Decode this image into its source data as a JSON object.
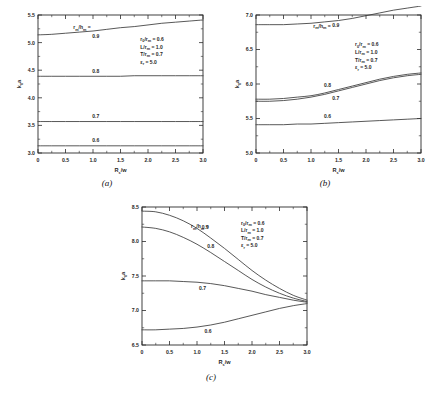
{
  "figure": {
    "panels": [
      {
        "id": "a",
        "caption": "(a)",
        "xlabel_main": "R",
        "xlabel_sub": "s",
        "xlabel_tail": "/w",
        "ylabel_main": "k",
        "ylabel_sub": "0",
        "ylabel_tail": "a",
        "legend_key_main": "r",
        "legend_key_sub1": "m",
        "legend_key_mid": "/h",
        "legend_key_sub2": "m",
        "legend_key_tail": " =",
        "params": [
          {
            "sym": "r",
            "sub": "0",
            "mid": "/r",
            "sub2": "m",
            "val": " = 0.6"
          },
          {
            "sym": "L",
            "sub": "",
            "mid": "/r",
            "sub2": "m",
            "val": " = 1.0"
          },
          {
            "sym": "T",
            "sub": "",
            "mid": "/r",
            "sub2": "m",
            "val": " = 0.7"
          },
          {
            "sym": "ε",
            "sub": "r",
            "mid": "",
            "sub2": "",
            "val": " = 5.0"
          }
        ],
        "xticks": [
          "0",
          "0.5",
          "1.0",
          "1.5",
          "2.0",
          "2.5",
          "3.0"
        ],
        "yticks": [
          "3.0",
          "3.5",
          "4.0",
          "4.5",
          "5.0",
          "5.5"
        ],
        "curve_labels": [
          "0.9",
          "0.8",
          "0.7",
          "0.6"
        ]
      },
      {
        "id": "b",
        "caption": "(b)",
        "xlabel_main": "R",
        "xlabel_sub": "s",
        "xlabel_tail": "/w",
        "ylabel_main": "k",
        "ylabel_sub": "0",
        "ylabel_tail": "a",
        "legend_key_main": "r",
        "legend_key_sub1": "m",
        "legend_key_mid": "/h",
        "legend_key_sub2": "m",
        "legend_key_tail": " =",
        "params": [
          {
            "sym": "r",
            "sub": "0",
            "mid": "/r",
            "sub2": "m",
            "val": " = 0.6"
          },
          {
            "sym": "L",
            "sub": "",
            "mid": "/r",
            "sub2": "m",
            "val": " = 1.0"
          },
          {
            "sym": "T",
            "sub": "",
            "mid": "/r",
            "sub2": "m",
            "val": " = 0.7"
          },
          {
            "sym": "ε",
            "sub": "r",
            "mid": "",
            "sub2": "",
            "val": " = 5.0"
          }
        ],
        "xticks": [
          "0",
          "0.5",
          "1.0",
          "1.5",
          "2.0",
          "2.5",
          "3.0"
        ],
        "yticks": [
          "5.0",
          "5.5",
          "6.0",
          "6.5",
          "7.0"
        ],
        "curve_labels": [
          "0.9",
          "0.8",
          "0.7",
          "0.6"
        ]
      },
      {
        "id": "c",
        "caption": "(c)",
        "xlabel_main": "R",
        "xlabel_sub": "s",
        "xlabel_tail": "/w",
        "ylabel_main": "k",
        "ylabel_sub": "0",
        "ylabel_tail": "a",
        "legend_key_main": "r",
        "legend_key_sub1": "m",
        "legend_key_mid": "/h",
        "legend_key_sub2": "m",
        "legend_key_tail": " =",
        "params": [
          {
            "sym": "r",
            "sub": "0",
            "mid": "/r",
            "sub2": "m",
            "val": " = 0.6"
          },
          {
            "sym": "L",
            "sub": "",
            "mid": "/r",
            "sub2": "m",
            "val": " = 1.0"
          },
          {
            "sym": "T",
            "sub": "",
            "mid": "/r",
            "sub2": "m",
            "val": " = 0.7"
          },
          {
            "sym": "ε",
            "sub": "r",
            "mid": "",
            "sub2": "",
            "val": " = 5.0"
          }
        ],
        "xticks": [
          "0",
          "0.5",
          "1.0",
          "1.5",
          "2.0",
          "2.5",
          "3.0"
        ],
        "yticks": [
          "6.5",
          "7.0",
          "7.5",
          "8.0",
          "8.5"
        ],
        "curve_labels": [
          "0.9",
          "0.8",
          "0.7",
          "0.6"
        ]
      }
    ]
  },
  "chart_data": [
    {
      "type": "line",
      "panel": "a",
      "title": "",
      "xlabel": "Rs/w",
      "ylabel": "k0a",
      "xlim": [
        0,
        3.0
      ],
      "ylim": [
        3.0,
        5.5
      ],
      "xticks": [
        0,
        0.5,
        1.0,
        1.5,
        2.0,
        2.5,
        3.0
      ],
      "yticks": [
        3.0,
        3.5,
        4.0,
        4.5,
        5.0,
        5.5
      ],
      "grid": false,
      "legend_title": "rm/hm =",
      "legend_position": "inline-curve-labels",
      "annotations": [
        "r0/rm = 0.6",
        "L/rm = 1.0",
        "T/rm = 0.7",
        "εr = 5.0"
      ],
      "x": [
        0,
        0.25,
        0.5,
        0.75,
        1.0,
        1.25,
        1.5,
        1.75,
        2.0,
        2.25,
        2.5,
        2.75,
        3.0
      ],
      "series": [
        {
          "name": "0.9",
          "values": [
            5.14,
            5.15,
            5.17,
            5.19,
            5.21,
            5.24,
            5.27,
            5.29,
            5.32,
            5.35,
            5.37,
            5.39,
            5.41
          ]
        },
        {
          "name": "0.8",
          "values": [
            4.39,
            4.39,
            4.39,
            4.39,
            4.39,
            4.39,
            4.39,
            4.4,
            4.4,
            4.4,
            4.4,
            4.4,
            4.4
          ]
        },
        {
          "name": "0.7",
          "values": [
            3.57,
            3.57,
            3.57,
            3.57,
            3.57,
            3.57,
            3.57,
            3.57,
            3.57,
            3.57,
            3.57,
            3.57,
            3.57
          ]
        },
        {
          "name": "0.6",
          "values": [
            3.13,
            3.13,
            3.13,
            3.13,
            3.13,
            3.13,
            3.13,
            3.13,
            3.13,
            3.13,
            3.13,
            3.13,
            3.13
          ]
        }
      ]
    },
    {
      "type": "line",
      "panel": "b",
      "title": "",
      "xlabel": "Rs/w",
      "ylabel": "k0a",
      "xlim": [
        0,
        3.0
      ],
      "ylim": [
        5.0,
        7.0
      ],
      "xticks": [
        0,
        0.5,
        1.0,
        1.5,
        2.0,
        2.5,
        3.0
      ],
      "yticks": [
        5.0,
        5.5,
        6.0,
        6.5,
        7.0
      ],
      "grid": false,
      "legend_title": "rm/hm =",
      "legend_position": "inline-curve-labels",
      "annotations": [
        "r0/rm = 0.6",
        "L/rm = 1.0",
        "T/rm = 0.7",
        "εr = 5.0"
      ],
      "x": [
        0,
        0.25,
        0.5,
        0.75,
        1.0,
        1.25,
        1.5,
        1.75,
        2.0,
        2.25,
        2.5,
        2.75,
        3.0
      ],
      "series": [
        {
          "name": "0.9",
          "values": [
            6.86,
            6.86,
            6.86,
            6.87,
            6.88,
            6.9,
            6.92,
            6.95,
            6.99,
            7.03,
            7.07,
            7.1,
            7.13
          ]
        },
        {
          "name": "0.8",
          "values": [
            5.78,
            5.78,
            5.79,
            5.81,
            5.83,
            5.87,
            5.92,
            5.97,
            6.02,
            6.07,
            6.11,
            6.14,
            6.16
          ]
        },
        {
          "name": "0.7",
          "values": [
            5.75,
            5.75,
            5.76,
            5.78,
            5.81,
            5.85,
            5.9,
            5.95,
            6.0,
            6.05,
            6.09,
            6.12,
            6.14
          ]
        },
        {
          "name": "0.6",
          "values": [
            5.41,
            5.41,
            5.41,
            5.42,
            5.42,
            5.43,
            5.44,
            5.45,
            5.46,
            5.47,
            5.48,
            5.49,
            5.5
          ]
        }
      ]
    },
    {
      "type": "line",
      "panel": "c",
      "title": "",
      "xlabel": "Rs/w",
      "ylabel": "k0a",
      "xlim": [
        0,
        3.0
      ],
      "ylim": [
        6.5,
        8.5
      ],
      "xticks": [
        0,
        0.5,
        1.0,
        1.5,
        2.0,
        2.5,
        3.0
      ],
      "yticks": [
        6.5,
        7.0,
        7.5,
        8.0,
        8.5
      ],
      "grid": false,
      "legend_title": "rm/hm =",
      "legend_position": "inline-curve-labels",
      "annotations": [
        "r0/rm = 0.6",
        "L/rm = 1.0",
        "T/rm = 0.7",
        "εr = 5.0"
      ],
      "x": [
        0,
        0.25,
        0.5,
        0.75,
        1.0,
        1.25,
        1.5,
        1.75,
        2.0,
        2.25,
        2.5,
        2.75,
        3.0
      ],
      "series": [
        {
          "name": "0.9",
          "values": [
            8.44,
            8.43,
            8.38,
            8.3,
            8.19,
            8.05,
            7.9,
            7.74,
            7.58,
            7.44,
            7.32,
            7.22,
            7.15
          ]
        },
        {
          "name": "0.8",
          "values": [
            8.21,
            8.19,
            8.14,
            8.06,
            7.96,
            7.84,
            7.71,
            7.58,
            7.45,
            7.34,
            7.25,
            7.18,
            7.13
          ]
        },
        {
          "name": "0.7",
          "values": [
            7.43,
            7.43,
            7.43,
            7.42,
            7.41,
            7.39,
            7.36,
            7.32,
            7.28,
            7.23,
            7.19,
            7.15,
            7.12
          ]
        },
        {
          "name": "0.6",
          "values": [
            6.72,
            6.72,
            6.73,
            6.74,
            6.76,
            6.79,
            6.83,
            6.88,
            6.93,
            6.98,
            7.03,
            7.07,
            7.1
          ]
        }
      ]
    }
  ]
}
